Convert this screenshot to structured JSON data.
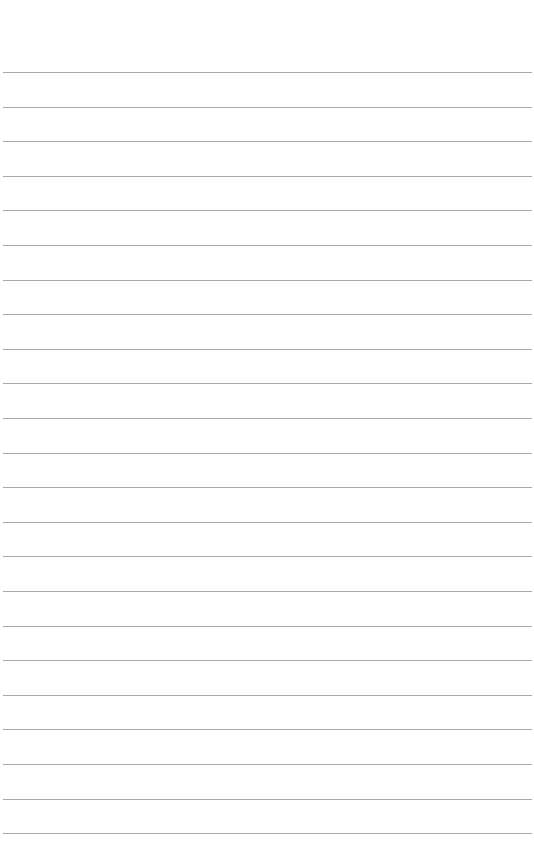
{
  "page": {
    "type": "blank lined paper",
    "background": "#ffffff",
    "rule_color": "#9a9a9a",
    "rule_count": 23,
    "first_rule_y": 72,
    "rule_spacing": 34.6,
    "text": ""
  }
}
